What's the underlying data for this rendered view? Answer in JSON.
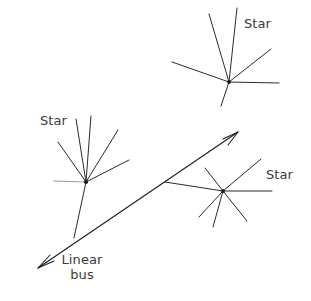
{
  "diagram": {
    "type": "network-topology",
    "background_color": "#ffffff",
    "line_color": "#2b2b2b",
    "faint_line_color": "#9a9a9a",
    "labels": {
      "star_top": "Star",
      "star_left": "Star",
      "star_right": "Star",
      "bus_line1": "Linear",
      "bus_line2": "bus"
    },
    "nodes": [
      {
        "id": "star-left",
        "label": "Star",
        "hub": [
          86,
          182
        ],
        "spokes": [
          [
            54,
            181
          ],
          [
            58,
            142
          ],
          [
            76,
            119
          ],
          [
            91,
            116
          ],
          [
            118,
            130
          ],
          [
            129,
            160
          ]
        ]
      },
      {
        "id": "star-top",
        "label": "Star",
        "hub": [
          229,
          82
        ],
        "spokes": [
          [
            209,
            14
          ],
          [
            237,
            8
          ],
          [
            271,
            49
          ],
          [
            279,
            83
          ],
          [
            172,
            62
          ]
        ]
      },
      {
        "id": "star-right",
        "label": "Star",
        "hub": [
          223,
          191
        ],
        "spokes": [
          [
            272,
            191
          ],
          [
            261,
            159
          ],
          [
            205,
            168
          ],
          [
            199,
            217
          ],
          [
            247,
            221
          ],
          [
            213,
            227
          ]
        ]
      }
    ],
    "bus": {
      "label": "Linear bus",
      "start": [
        38,
        268
      ],
      "end": [
        238,
        132
      ],
      "arrow_forward_tip": [
        238,
        132
      ],
      "arrow_back_tip": [
        38,
        268
      ]
    },
    "drops": [
      {
        "from": "star-left",
        "to_bus_point": [
          74,
          238
        ]
      },
      {
        "from": "star-top",
        "to_bus_point": [
          221,
          106
        ]
      },
      {
        "from": "star-right",
        "to_bus_point": [
          165,
          182
        ]
      }
    ]
  }
}
